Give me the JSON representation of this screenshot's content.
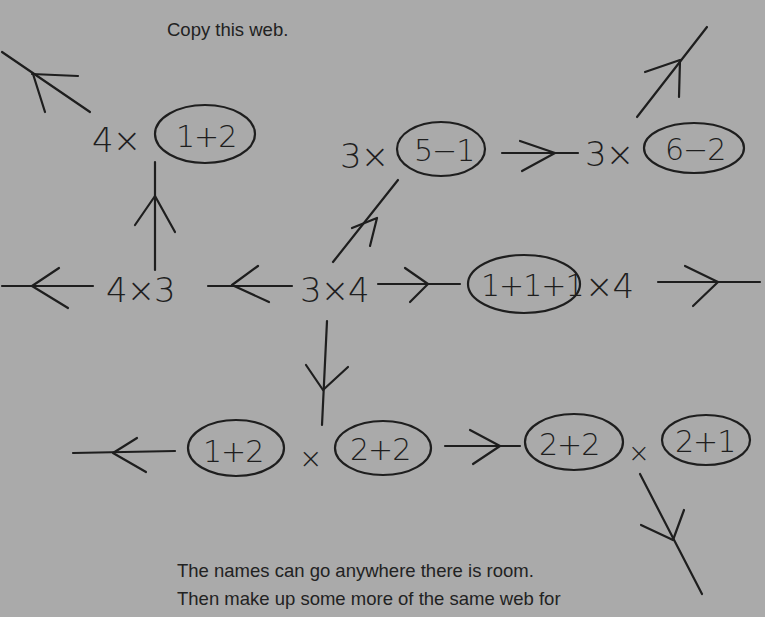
{
  "instructions": {
    "top": "Copy this web.",
    "bottom_line_1": "The names can go anywhere there is room.",
    "bottom_line_2": "Then make up some more of the same web for"
  },
  "web": {
    "center": {
      "text": "3×4",
      "parts": [
        "3",
        "×",
        "4"
      ]
    },
    "nodes": [
      {
        "id": "left",
        "text": "4×3",
        "parts": [
          "4",
          "×",
          "3"
        ]
      },
      {
        "id": "top_left",
        "text": "4×(1+2)",
        "prefix": "4×",
        "oval": "1+2"
      },
      {
        "id": "upper_middle",
        "text": "3×(5−1)",
        "prefix": "3×",
        "oval": "5−1"
      },
      {
        "id": "upper_right",
        "text": "3×(6−2)",
        "prefix": "3×",
        "oval": "6−2"
      },
      {
        "id": "right",
        "text": "(1+1+1)×4",
        "oval": "1+1+1",
        "suffix": "×4"
      },
      {
        "id": "bottom_left",
        "text": "(1+2)×(2+2)",
        "oval_a": "1+2",
        "op": "×",
        "oval_b": "2+2"
      },
      {
        "id": "bottom_right",
        "text": "(2+2)×(2+1)",
        "oval_a": "2+2",
        "op": "×",
        "oval_b": "2+1"
      }
    ],
    "edges": [
      {
        "from": "center",
        "to": "left",
        "direction": "left"
      },
      {
        "from": "left",
        "to": "offscreen",
        "direction": "left"
      },
      {
        "from": "left",
        "to": "top_left",
        "direction": "up"
      },
      {
        "from": "top_left",
        "to": "offscreen",
        "direction": "up-left"
      },
      {
        "from": "center",
        "to": "upper_middle",
        "direction": "up-right"
      },
      {
        "from": "upper_middle",
        "to": "upper_right",
        "direction": "right"
      },
      {
        "from": "upper_right",
        "to": "offscreen",
        "direction": "up-right"
      },
      {
        "from": "center",
        "to": "right",
        "direction": "right"
      },
      {
        "from": "right",
        "to": "offscreen",
        "direction": "right"
      },
      {
        "from": "center",
        "to": "bottom_left",
        "direction": "down"
      },
      {
        "from": "bottom_left",
        "to": "offscreen",
        "direction": "left"
      },
      {
        "from": "bottom_left",
        "to": "bottom_right",
        "direction": "right"
      },
      {
        "from": "bottom_right",
        "to": "offscreen",
        "direction": "down-right"
      }
    ],
    "ink_color": "#1e1e1e",
    "paper_color": "#aaaaaa"
  }
}
